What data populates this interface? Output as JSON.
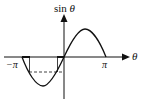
{
  "diagram": {
    "y_axis_label_func": "sin",
    "y_axis_label_var": "θ",
    "x_axis_label": "θ",
    "tick_labels": {
      "neg_pi": "−π",
      "pi": "π"
    },
    "colors": {
      "stroke": "#111111",
      "background": "#ffffff"
    }
  }
}
